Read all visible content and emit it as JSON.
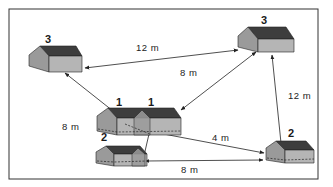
{
  "diagram": {
    "title": "",
    "houses": [
      {
        "id": "house-top-left",
        "label": "3"
      },
      {
        "id": "house-top-right",
        "label": "3"
      },
      {
        "id": "house-center-upper",
        "labels": [
          "1",
          "1"
        ]
      },
      {
        "id": "house-center-lower",
        "label": "2"
      },
      {
        "id": "house-bottom-right",
        "label": "2"
      }
    ],
    "distances": [
      {
        "from": "house-top-right",
        "to": "house-top-left",
        "label": "12 m"
      },
      {
        "from": "house-top-right",
        "to": "house-center-upper",
        "label": "8 m"
      },
      {
        "from": "house-center-upper",
        "to": "house-top-left",
        "label": "8 m"
      },
      {
        "from": "house-bottom-right",
        "to": "house-top-right",
        "label": "12 m"
      },
      {
        "from": "house-center-upper",
        "to": "house-bottom-right",
        "label": "4 m"
      },
      {
        "from": "house-center-lower",
        "to": "house-bottom-right",
        "label": "8 m"
      }
    ],
    "colors": {
      "roof": "#3d3d3d",
      "gable": "#9a9a9a",
      "wall": "#b5b5b5",
      "line": "#222222",
      "background": "#ffffff"
    }
  }
}
